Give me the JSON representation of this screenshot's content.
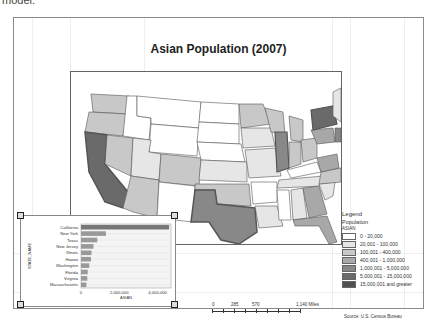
{
  "window": {
    "top_text": "model."
  },
  "layout_view": {
    "title": "Asian Population (2007)",
    "legend": {
      "title": "Legend",
      "layer": "Population",
      "field": "ASIAN",
      "classes": [
        {
          "label": "0 - 20,000",
          "color": "#ffffff"
        },
        {
          "label": "20,001 - 100,000",
          "color": "#e6e6e6"
        },
        {
          "label": "100,001 - 400,000",
          "color": "#c8c8c8"
        },
        {
          "label": "400,001 - 1,000,000",
          "color": "#a8a8a8"
        },
        {
          "label": "1,000,001 - 5,000,000",
          "color": "#888888"
        },
        {
          "label": "5,000,001 - 15,000,000",
          "color": "#6a6a6a"
        },
        {
          "label": "15,000,001 and greater",
          "color": "#505050"
        }
      ]
    },
    "scale_bar": {
      "labels": [
        "0",
        "285",
        "570",
        "1,140 Miles"
      ]
    },
    "source": "Source: U.S. Census Bureau",
    "map_labels": [
      "Washington",
      "Oregon",
      "California",
      "Nevada",
      "Idaho",
      "Montana",
      "Wyoming",
      "Utah",
      "Colorado",
      "Arizona",
      "New Mexico",
      "North Dakota",
      "South Dakota",
      "Nebraska",
      "Kansas",
      "Oklahoma",
      "Texas",
      "Minnesota",
      "Iowa",
      "Missouri",
      "Arkansas",
      "Louisiana",
      "Wisconsin",
      "Illinois",
      "Michigan",
      "Indiana",
      "Ohio",
      "Kentucky",
      "Tennessee",
      "Mississippi",
      "Alabama",
      "Georgia",
      "Florida",
      "South Carolina",
      "North Carolina",
      "Virginia",
      "West Virginia",
      "Pennsylvania",
      "New York",
      "Maine",
      "New Hampshire",
      "Vermont",
      "Massachusetts",
      "New Jersey"
    ]
  },
  "chart_data": {
    "type": "bar",
    "orientation": "horizontal",
    "title": "",
    "xlabel": "ASIAN",
    "ylabel": "STATE_NAME",
    "categories": [
      "California",
      "New York",
      "Texas",
      "New Jersey",
      "Illinois",
      "Hawaii",
      "Washington",
      "Florida",
      "Virginia",
      "Massachusetts"
    ],
    "values": [
      4600000,
      1300000,
      850000,
      650000,
      550000,
      520000,
      430000,
      350000,
      330000,
      280000
    ],
    "xlim": [
      0,
      4700000
    ],
    "xticks": [
      "0",
      "2,000,000",
      "4,000,000"
    ],
    "grid": true,
    "bar_color": "#999999"
  }
}
